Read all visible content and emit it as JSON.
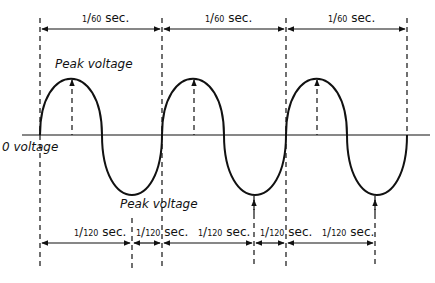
{
  "diagram": {
    "type": "ac-sine-wave",
    "labels": {
      "peak_positive": "Peak voltage",
      "peak_negative": "Peak voltage",
      "zero": "0 voltage"
    },
    "period_labels": [
      {
        "num": "1",
        "den": "60",
        "unit": "sec."
      },
      {
        "num": "1",
        "den": "60",
        "unit": "sec."
      },
      {
        "num": "1",
        "den": "60",
        "unit": "sec."
      }
    ],
    "half_period_labels": [
      {
        "num": "1",
        "den": "120",
        "unit": "sec."
      },
      {
        "num": "1",
        "den": "120",
        "unit": "sec."
      },
      {
        "num": "1",
        "den": "120",
        "unit": "sec."
      },
      {
        "num": "1",
        "den": "120",
        "unit": "sec."
      },
      {
        "num": "1",
        "den": "120",
        "unit": "sec."
      }
    ],
    "cycles": 3,
    "colors": {
      "line": "#111111",
      "background": "#ffffff"
    }
  }
}
